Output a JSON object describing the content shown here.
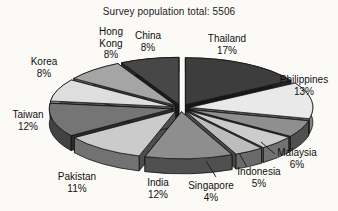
{
  "figure": {
    "background": "#fbfaf6",
    "text_color": "#101010"
  },
  "chart_data": {
    "type": "pie",
    "effect": "3d-exploded",
    "title": "Survey population total: 5506",
    "total_population": 5506,
    "unit": "%",
    "start_angle_deg": 0,
    "clockwise": true,
    "legend_position": "labels-around-pie",
    "slices": [
      {
        "label": "Thailand",
        "value": 17,
        "color": "#3d3d3d"
      },
      {
        "label": "Philippines",
        "value": 13,
        "color": "#e9e9e9"
      },
      {
        "label": "Malaysia",
        "value": 6,
        "color": "#8f8f8f"
      },
      {
        "label": "Indonesia",
        "value": 5,
        "color": "#cccccc"
      },
      {
        "label": "Singapore",
        "value": 4,
        "color": "#bdbdbd"
      },
      {
        "label": "India",
        "value": 12,
        "color": "#8e8e8e"
      },
      {
        "label": "Pakistan",
        "value": 11,
        "color": "#cbcbcb"
      },
      {
        "label": "Taiwan",
        "value": 12,
        "color": "#757575"
      },
      {
        "label": "Korea",
        "value": 8,
        "color": "#dedede"
      },
      {
        "label": "Hong Kong",
        "value": 8,
        "color": "#a5a5a5"
      },
      {
        "label": "China",
        "value": 8,
        "color": "#474747"
      }
    ]
  }
}
